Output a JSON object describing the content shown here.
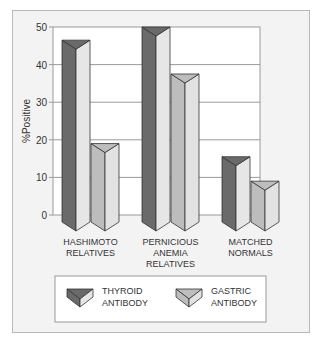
{
  "chart_data": {
    "type": "bar",
    "title": "",
    "xlabel": "",
    "ylabel": "%Positive",
    "ylim": [
      0,
      50
    ],
    "yticks": [
      0,
      10,
      20,
      30,
      40,
      50
    ],
    "grid": true,
    "legend_position": "bottom",
    "categories": [
      [
        "HASHIMOTO",
        "RELATIVES"
      ],
      [
        "PERNICIOUS",
        "ANEMIA",
        "RELATIVES"
      ],
      [
        "MATCHED",
        "NORMALS"
      ]
    ],
    "series": [
      {
        "name": "THYROID ANTIBODY",
        "legend_lines": [
          "THYROID",
          "ANTIBODY"
        ],
        "values": [
          46.5,
          50,
          15.5
        ],
        "color_dark": "#6a6a6a",
        "color_light": "#e6e6e6"
      },
      {
        "name": "GASTRIC ANTIBODY",
        "legend_lines": [
          "GASTRIC",
          "ANTIBODY"
        ],
        "values": [
          19,
          37.5,
          9
        ],
        "color_dark": "#bdbdbd",
        "color_light": "#e2e2e2"
      }
    ]
  }
}
